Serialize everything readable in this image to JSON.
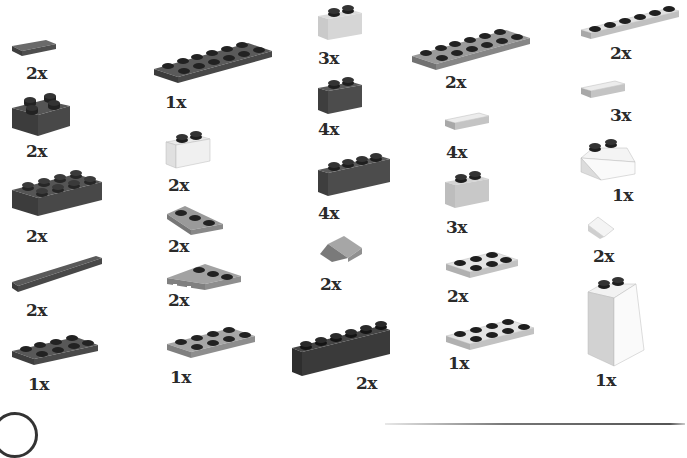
{
  "page": {
    "colors": {
      "dark_gray": "#4a4a4a",
      "medium_gray": "#8c8c8c",
      "light_gray": "#cfcfcf",
      "white": "#f2f2f2",
      "stud_dark": "#1e1e1e",
      "label": "#2a2a2a"
    }
  },
  "columns": [
    {
      "name": "column-1",
      "parts": [
        {
          "shape": "tile-1x2",
          "color": "dark_gray",
          "qty": "2x"
        },
        {
          "shape": "brick-2x2",
          "color": "dark_gray",
          "qty": "2x"
        },
        {
          "shape": "brick-2x4",
          "color": "dark_gray",
          "qty": "2x"
        },
        {
          "shape": "tile-1x6",
          "color": "dark_gray",
          "qty": "2x"
        },
        {
          "shape": "plate-2x4",
          "color": "dark_gray",
          "qty": "1x"
        }
      ]
    },
    {
      "name": "column-2",
      "parts": [
        {
          "shape": "plate-2x6",
          "color": "dark_gray",
          "qty": "1x"
        },
        {
          "shape": "brick-1x2",
          "color": "white",
          "qty": "2x"
        },
        {
          "shape": "wedge-plate-2x3-right",
          "color": "medium_gray",
          "qty": "2x"
        },
        {
          "shape": "wedge-plate-2x4-left",
          "color": "medium_gray",
          "qty": "2x"
        },
        {
          "shape": "plate-2x4",
          "color": "medium_gray",
          "qty": "1x"
        }
      ]
    },
    {
      "name": "column-3",
      "parts": [
        {
          "shape": "brick-1x2",
          "color": "light_gray",
          "qty": "3x"
        },
        {
          "shape": "brick-1x2",
          "color": "dark_gray",
          "qty": "4x"
        },
        {
          "shape": "brick-1x4",
          "color": "dark_gray",
          "qty": "4x"
        },
        {
          "shape": "slope-1x2",
          "color": "medium_gray",
          "qty": "2x"
        },
        {
          "shape": "brick-1x6",
          "color": "dark_gray",
          "qty": "2x"
        }
      ]
    },
    {
      "name": "column-4",
      "parts": [
        {
          "shape": "plate-2x6",
          "color": "medium_gray",
          "qty": "2x"
        },
        {
          "shape": "tile-1x2",
          "color": "light_gray",
          "qty": "4x"
        },
        {
          "shape": "brick-1x2",
          "color": "light_gray",
          "qty": "3x"
        },
        {
          "shape": "plate-2x3",
          "color": "light_gray",
          "qty": "2x"
        },
        {
          "shape": "plate-2x4",
          "color": "light_gray",
          "qty": "1x"
        }
      ]
    },
    {
      "name": "column-5",
      "parts": [
        {
          "shape": "plate-1x6",
          "color": "light_gray",
          "qty": "2x"
        },
        {
          "shape": "tile-1x2",
          "color": "light_gray",
          "qty": "3x"
        },
        {
          "shape": "slope-2x2",
          "color": "white",
          "qty": "1x"
        },
        {
          "shape": "slope-1x1",
          "color": "white",
          "qty": "2x"
        },
        {
          "shape": "slope-2x2x3",
          "color": "white",
          "qty": "1x"
        }
      ]
    }
  ],
  "footer": {
    "step_marker": "",
    "rule": true
  }
}
